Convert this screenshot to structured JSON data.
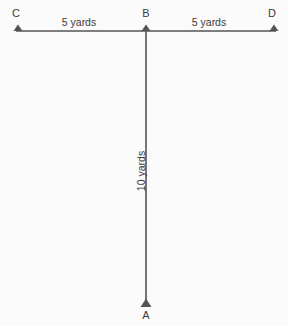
{
  "diagram": {
    "background_color": "#fbfbfb",
    "stroke_color": "#555555",
    "text_color": "#3a3a3a",
    "points": [
      {
        "id": "c",
        "label": "C",
        "marker": "triangle-up-marker"
      },
      {
        "id": "b",
        "label": "B",
        "marker": "triangle-up-marker"
      },
      {
        "id": "d",
        "label": "D",
        "marker": "triangle-up-marker"
      },
      {
        "id": "a",
        "label": "A",
        "marker": "triangle-up-marker"
      }
    ],
    "segments": [
      {
        "id": "cb",
        "label": "5 yards",
        "value": 5,
        "unit": "yards",
        "orientation": "horizontal"
      },
      {
        "id": "bd",
        "label": "5 yards",
        "value": 5,
        "unit": "yards",
        "orientation": "horizontal"
      },
      {
        "id": "ab",
        "label": "10 yards",
        "value": 10,
        "unit": "yards",
        "orientation": "vertical"
      }
    ]
  }
}
